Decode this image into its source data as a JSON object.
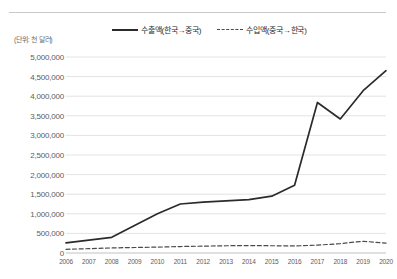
{
  "unit_note": "(단위: 천 달러)",
  "legend": {
    "position": "top-center",
    "items": [
      {
        "label": "수출액(한국→중국)",
        "style": "solid",
        "color": "#2b2b2b",
        "icon": "solid-line-icon"
      },
      {
        "label": "수입액(중국→한국)",
        "style": "dashed",
        "color": "#4a4a4a",
        "icon": "dashed-line-icon"
      }
    ]
  },
  "chart_data": {
    "type": "line",
    "title": "",
    "subtitle": "",
    "xlabel": "",
    "ylabel": "(단위: 천 달러)",
    "categories": [
      "2006",
      "2007",
      "2008",
      "2009",
      "2010",
      "2011",
      "2012",
      "2013",
      "2014",
      "2015",
      "2016",
      "2017",
      "2018",
      "2019",
      "2020"
    ],
    "ylim": [
      0,
      5000000
    ],
    "ytick_labels": [
      "0",
      "500,000",
      "1,000,000",
      "1,500,000",
      "2,000,000",
      "2,500,000",
      "3,000,000",
      "3,500,000",
      "4,000,000",
      "4,500,000",
      "5,000,000"
    ],
    "ytick_values": [
      0,
      500000,
      1000000,
      1500000,
      2000000,
      2500000,
      3000000,
      3500000,
      4000000,
      4500000,
      5000000
    ],
    "grid": true,
    "grid_axis": "y",
    "legend_position": "top-center",
    "series": [
      {
        "name": "수출액(한국→중국)",
        "style": "solid",
        "color": "#2b2b2b",
        "values": [
          260000,
          330000,
          400000,
          700000,
          1000000,
          1250000,
          1300000,
          1330000,
          1360000,
          1450000,
          1730000,
          3840000,
          3420000,
          4140000,
          4650000
        ]
      },
      {
        "name": "수입액(중국→한국)",
        "style": "dashed",
        "color": "#4a4a4a",
        "values": [
          95000,
          110000,
          130000,
          140000,
          150000,
          165000,
          175000,
          185000,
          190000,
          185000,
          180000,
          200000,
          240000,
          300000,
          250000
        ]
      }
    ]
  }
}
